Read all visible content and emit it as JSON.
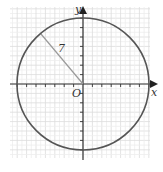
{
  "diagram": {
    "type": "circle-on-coordinate-grid",
    "axes": {
      "x_label": "x",
      "y_label": "y",
      "origin_label": "O"
    },
    "circle": {
      "center": [
        0,
        0
      ],
      "radius": 7,
      "radius_label": "7"
    },
    "grid": {
      "unit_px": 9.4,
      "x_range": [
        -7.8,
        7.8
      ],
      "y_range": [
        -8,
        8
      ]
    },
    "colors": {
      "grid": "#dcdcdc",
      "grid_minor": "#eeeeee",
      "axis": "#333333",
      "circle": "#555555",
      "radius_line": "#9a9a9a"
    }
  }
}
